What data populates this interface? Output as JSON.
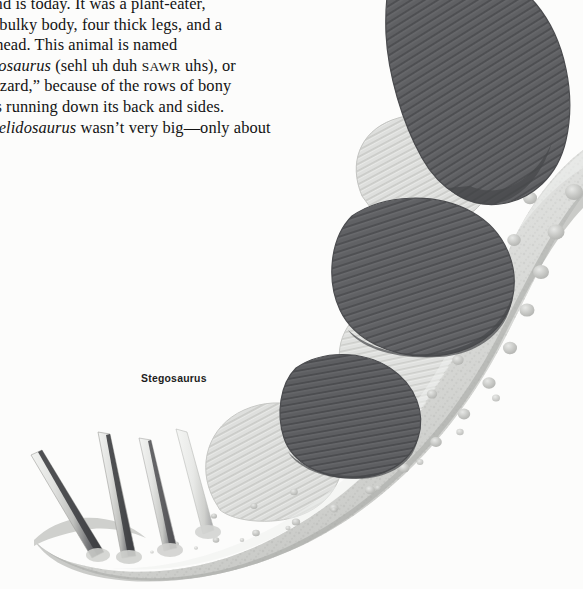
{
  "page": {
    "background_color": "#fcfcfb",
    "width": 583,
    "height": 589
  },
  "body_text": {
    "lines": [
      "ngland is today. It was a plant-eater,",
      "ith a bulky body, four thick legs, and a",
      "nall head. This animal is named",
      "celidosaurus (sehl uh duh SAWR uhs), or",
      "ide lizard,” because of the rows of bony",
      "umps running down its back and sides.",
      "Scelidosaurus wasn’t very big—only about"
    ],
    "line4_italic": "celidosaurus",
    "line4_rest_a": " (sehl uh duh ",
    "line4_smallcaps": "SAWR",
    "line4_rest_b": " uhs), or",
    "line7_italic": "Scelidosaurus",
    "line7_rest": " wasn’t very big—only about",
    "text_color": "#131313"
  },
  "caption": {
    "label": "Stegosaurus",
    "color": "#1d1d1d"
  },
  "illustration": {
    "subject": "Stegosaurus rear body, back plates and tail spikes",
    "colors": {
      "plate_dark": "#5f6063",
      "plate_dark_shadow": "#494a4d",
      "plate_light": "#d5d6d4",
      "plate_light_edge": "#c2c3c1",
      "body_base": "#d9dad7",
      "body_shadow": "#b9bab7",
      "body_highlight": "#eceded",
      "bump": "#b4b6b3",
      "spike_light": "#e6e7e5",
      "spike_dark": "#3c3d40",
      "outline": "#9b9c99"
    },
    "parts": {
      "dark_plates_count": 3,
      "light_plates_count": 3,
      "tail_spikes_count": 4,
      "osteoderm_rows": 3
    }
  }
}
